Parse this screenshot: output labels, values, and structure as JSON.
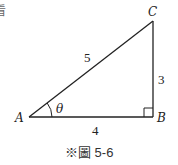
{
  "figure": {
    "caption": "※圖 5-6",
    "partial_glyph": "看",
    "vertices": {
      "A": {
        "label": "A",
        "x": 29,
        "y": 117
      },
      "B": {
        "label": "B",
        "x": 153,
        "y": 117
      },
      "C": {
        "label": "C",
        "x": 153,
        "y": 21
      }
    },
    "sides": {
      "hypotenuse_AC": "5",
      "opposite_BC": "3",
      "adjacent_AB": "4"
    },
    "angle_label": "θ",
    "right_angle_at": "B",
    "colors": {
      "stroke": "#222222",
      "text": "#222222",
      "background": "#ffffff"
    }
  }
}
